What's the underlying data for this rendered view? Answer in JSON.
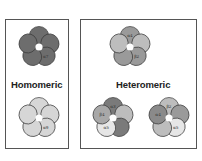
{
  "diagram": {
    "homomeric": {
      "title": "Homomeric",
      "flowers": [
        {
          "name": "alpha7-homomer",
          "petals": [
            {
              "fill": "#6d6d6d",
              "label": ""
            },
            {
              "fill": "#6d6d6d",
              "label": ""
            },
            {
              "fill": "#6d6d6d",
              "label": "α7"
            },
            {
              "fill": "#6d6d6d",
              "label": ""
            },
            {
              "fill": "#6d6d6d",
              "label": ""
            }
          ]
        },
        {
          "name": "alpha9-homomer",
          "petals": [
            {
              "fill": "#d6d6d6",
              "label": ""
            },
            {
              "fill": "#d6d6d6",
              "label": ""
            },
            {
              "fill": "#d6d6d6",
              "label": "α9"
            },
            {
              "fill": "#d6d6d6",
              "label": ""
            },
            {
              "fill": "#d6d6d6",
              "label": ""
            }
          ]
        }
      ]
    },
    "heteromeric": {
      "title": "Heteromeric",
      "flowers": [
        {
          "name": "alpha4-beta2",
          "petals": [
            {
              "fill": "#9a9a9a",
              "label": "α4"
            },
            {
              "fill": "#bdbdbd",
              "label": ""
            },
            {
              "fill": "#9a9a9a",
              "label": "β2"
            },
            {
              "fill": "#9a9a9a",
              "label": ""
            },
            {
              "fill": "#bdbdbd",
              "label": ""
            }
          ]
        },
        {
          "name": "alpha3-beta4-alpha5",
          "petals": [
            {
              "fill": "#7a7a7a",
              "label": "α3"
            },
            {
              "fill": "#bdbdbd",
              "label": ""
            },
            {
              "fill": "#7a7a7a",
              "label": ""
            },
            {
              "fill": "#e6e6e6",
              "label": "α5"
            },
            {
              "fill": "#a8a8a8",
              "label": "β4"
            }
          ]
        },
        {
          "name": "alpha4-beta2-alpha5",
          "petals": [
            {
              "fill": "#bdbdbd",
              "label": "β2"
            },
            {
              "fill": "#9a9a9a",
              "label": ""
            },
            {
              "fill": "#e6e6e6",
              "label": "α5"
            },
            {
              "fill": "#bdbdbd",
              "label": ""
            },
            {
              "fill": "#8a8a8a",
              "label": "α4"
            }
          ]
        }
      ]
    }
  }
}
